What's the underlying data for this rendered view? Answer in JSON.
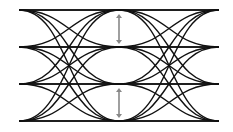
{
  "diagram": {
    "type": "PAM4 eye diagram",
    "levels_y": [
      10,
      47,
      84,
      121
    ],
    "x_left": 19,
    "x_center": 119,
    "x_right": 219,
    "line_color": "#111111",
    "arrow_color": "#888888",
    "arrows": [
      {
        "x": 119,
        "y1": 14,
        "y2": 44
      },
      {
        "x": 119,
        "y1": 88,
        "y2": 118
      }
    ]
  }
}
